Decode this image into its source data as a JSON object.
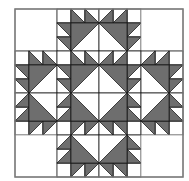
{
  "quilt": {
    "name": "Bear's Paw quilt pattern",
    "origin": [
      15,
      9
    ],
    "grid_size": 4,
    "block_size": 42,
    "unit": 14,
    "colors": {
      "background": "#ffffff",
      "dark_fabric": "#6e6e6e",
      "light_fabric": "#ffffff",
      "seam_line": "#1e1e1e",
      "outer_border": "#7a7a7a"
    },
    "blocks": [
      {
        "row": 0,
        "col": 0,
        "type": "empty"
      },
      {
        "row": 0,
        "col": 1,
        "type": "paw",
        "corner": "TL"
      },
      {
        "row": 0,
        "col": 2,
        "type": "paw",
        "corner": "TR"
      },
      {
        "row": 0,
        "col": 3,
        "type": "empty"
      },
      {
        "row": 1,
        "col": 0,
        "type": "paw",
        "corner": "TL"
      },
      {
        "row": 1,
        "col": 1,
        "type": "paw",
        "corner": "TL"
      },
      {
        "row": 1,
        "col": 2,
        "type": "paw",
        "corner": "TR"
      },
      {
        "row": 1,
        "col": 3,
        "type": "paw",
        "corner": "TR"
      },
      {
        "row": 2,
        "col": 0,
        "type": "paw",
        "corner": "BL"
      },
      {
        "row": 2,
        "col": 1,
        "type": "paw",
        "corner": "BL"
      },
      {
        "row": 2,
        "col": 2,
        "type": "paw",
        "corner": "BR"
      },
      {
        "row": 2,
        "col": 3,
        "type": "paw",
        "corner": "BR"
      },
      {
        "row": 3,
        "col": 0,
        "type": "empty"
      },
      {
        "row": 3,
        "col": 1,
        "type": "paw",
        "corner": "BL"
      },
      {
        "row": 3,
        "col": 2,
        "type": "paw",
        "corner": "BR"
      },
      {
        "row": 3,
        "col": 3,
        "type": "empty"
      }
    ]
  }
}
